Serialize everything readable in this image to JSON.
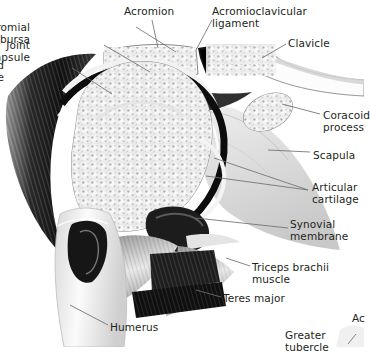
{
  "figure": {
    "kind": "anatomical-illustration",
    "background_color": "#ffffff",
    "text_color": "#231f20",
    "leader_line_color": "#6f6f73"
  },
  "labels": [
    {
      "id": "subacromial-bursa",
      "text": "Subacromial bursa",
      "side": "left",
      "x": 30,
      "y": 22,
      "align": "right"
    },
    {
      "id": "joint-capsule",
      "text": "Joint capsule",
      "side": "left",
      "x": 30,
      "y": 40,
      "align": "right"
    },
    {
      "id": "deltoid-muscle",
      "text": "Deltoid muscle",
      "side": "left",
      "x": 4,
      "y": 60,
      "align": "right"
    },
    {
      "id": "acromion",
      "text": "Acromion",
      "side": "top",
      "x": 124,
      "y": 6,
      "align": "left"
    },
    {
      "id": "acromioclavicular-ligament",
      "text": "Acromioclavicular\nligament",
      "side": "top",
      "x": 212,
      "y": 6,
      "align": "left"
    },
    {
      "id": "clavicle",
      "text": "Clavicle",
      "side": "right",
      "x": 288,
      "y": 38,
      "align": "left"
    },
    {
      "id": "coracoid-process",
      "text": "Coracoid\nprocess",
      "side": "right",
      "x": 323,
      "y": 110,
      "align": "left"
    },
    {
      "id": "scapula",
      "text": "Scapula",
      "side": "right",
      "x": 313,
      "y": 150,
      "align": "left"
    },
    {
      "id": "articular-cartilage",
      "text": "Articular\ncartilage",
      "side": "right",
      "x": 312,
      "y": 182,
      "align": "left"
    },
    {
      "id": "synovial-membrane",
      "text": "Synovial\nmembrane",
      "side": "right",
      "x": 290,
      "y": 219,
      "align": "left"
    },
    {
      "id": "triceps-brachii-muscle",
      "text": "Triceps brachii\nmuscle",
      "side": "right",
      "x": 252,
      "y": 262,
      "align": "left"
    },
    {
      "id": "teres-major",
      "text": "Teres major",
      "side": "right",
      "x": 223,
      "y": 293,
      "align": "left"
    },
    {
      "id": "humerus",
      "text": "Humerus",
      "side": "bottom",
      "x": 110,
      "y": 322,
      "align": "left"
    },
    {
      "id": "greater-tubercle",
      "text": "Greater tubercle",
      "side": "bottom",
      "x": 285,
      "y": 330,
      "align": "left"
    },
    {
      "id": "clipped-right-edge",
      "text": "Ac",
      "side": "right",
      "x": 352,
      "y": 313,
      "align": "left"
    }
  ],
  "structures": [
    {
      "id": "deltoid-muscle",
      "name": "Deltoid muscle",
      "tone": "dark-striated"
    },
    {
      "id": "acromion",
      "name": "Acromion",
      "tone": "trabecular-bone"
    },
    {
      "id": "clavicle",
      "name": "Clavicle",
      "tone": "trabecular-bone"
    },
    {
      "id": "acromioclavicular-ligament",
      "name": "Acromioclavicular ligament",
      "tone": "dark-wedge"
    },
    {
      "id": "humeral-head",
      "name": "Head of humerus",
      "tone": "trabecular-bone"
    },
    {
      "id": "joint-capsule",
      "name": "Joint capsule",
      "tone": "dark-arc"
    },
    {
      "id": "subacromial-bursa",
      "name": "Subacromial bursa",
      "tone": "light-slit"
    },
    {
      "id": "articular-cartilage",
      "name": "Articular cartilage",
      "tone": "light-band"
    },
    {
      "id": "glenoid-cavity",
      "name": "Glenoid cavity",
      "tone": "dark-socket"
    },
    {
      "id": "coracoid-process",
      "name": "Coracoid process",
      "tone": "trabecular-bone"
    },
    {
      "id": "scapula",
      "name": "Scapula",
      "tone": "soft-grey"
    },
    {
      "id": "synovial-membrane",
      "name": "Synovial membrane",
      "tone": "pale-grey"
    },
    {
      "id": "triceps-brachii-muscle",
      "name": "Triceps brachii muscle",
      "tone": "dark-slab"
    },
    {
      "id": "teres-major",
      "name": "Teres major",
      "tone": "dark-slab"
    },
    {
      "id": "humerus-shaft",
      "name": "Humerus",
      "tone": "pale-cortex"
    },
    {
      "id": "marrow-cavity",
      "name": "Medullary cavity",
      "tone": "dark-cavity"
    },
    {
      "id": "greater-tubercle",
      "name": "Greater tubercle",
      "tone": "bone"
    }
  ]
}
